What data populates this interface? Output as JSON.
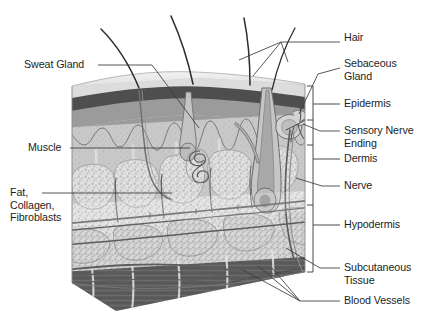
{
  "figure": {
    "type": "anatomical-diagram",
    "background_color": "#ffffff",
    "ink_color": "#1d1d1d"
  },
  "palette": {
    "stratum_corneum": "#d9d9d9",
    "epidermis_dark_band": "#4f4f4f",
    "epidermis_mid": "#9a9a9a",
    "dermis": "#c9c9c9",
    "dermis_papillae": "#b0b0b0",
    "hypodermis_fat": "#dcdcdc",
    "fat_lobule_outline": "#8a8a8a",
    "muscle_dark": "#5a5a5a",
    "muscle_mid": "#787878",
    "vessel_line": "#6a6a6a",
    "hair_shaft": "#3a3a3a",
    "leader_line": "#3a3a3a",
    "bracket_line": "#4a4a4a"
  },
  "labels": {
    "right": [
      {
        "id": "hair",
        "text": "Hair",
        "x": 344,
        "y": 38
      },
      {
        "id": "sebaceous-gland",
        "text": "Sebaceous\nGland",
        "x": 344,
        "y": 63
      },
      {
        "id": "epidermis",
        "text": "Epidermis",
        "x": 344,
        "y": 100
      },
      {
        "id": "sensory-nerve-ending",
        "text": "Sensory Nerve\nEnding",
        "x": 344,
        "y": 124
      },
      {
        "id": "dermis",
        "text": "Dermis",
        "x": 344,
        "y": 155
      },
      {
        "id": "nerve",
        "text": "Nerve",
        "x": 344,
        "y": 181
      },
      {
        "id": "hypodermis",
        "text": "Hypodermis",
        "x": 344,
        "y": 221
      },
      {
        "id": "subcutaneous-tissue",
        "text": "Subcutaneous\nTissue",
        "x": 344,
        "y": 263
      },
      {
        "id": "blood-vessels",
        "text": "Blood Vessels",
        "x": 344,
        "y": 297
      }
    ],
    "left": [
      {
        "id": "sweat-gland",
        "text": "Sweat Gland",
        "x": 24,
        "y": 61
      },
      {
        "id": "muscle",
        "text": "Muscle",
        "x": 28,
        "y": 144
      },
      {
        "id": "fat-collagen-fibroblasts",
        "text": "Fat,\nCollagen,\nFibroblasts",
        "x": 10,
        "y": 189
      }
    ]
  },
  "structures": {
    "hair_shafts": 4,
    "layers_top_to_bottom": [
      "Epidermis",
      "Dermis",
      "Hypodermis",
      "Subcutaneous Tissue",
      "Muscle"
    ]
  }
}
